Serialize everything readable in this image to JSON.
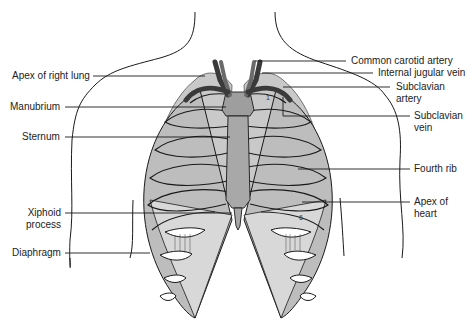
{
  "figure": {
    "colors": {
      "outline": "#1a1a1a",
      "rib_fill": "#b4b4b4",
      "rib_light": "#d6d6d6",
      "cartilage": "#e8e8e8",
      "sternum": "#a8a8a8",
      "vessel": "#555555",
      "background": "#ffffff"
    },
    "rib_numbers": [
      "1",
      "6"
    ]
  },
  "labels_left": [
    {
      "id": "apex-right-lung",
      "lines": [
        "Apex of right lung"
      ]
    },
    {
      "id": "manubrium",
      "lines": [
        "Manubrium"
      ]
    },
    {
      "id": "sternum",
      "lines": [
        "Sternum"
      ]
    },
    {
      "id": "xiphoid-process",
      "lines": [
        "Xiphoid",
        "process"
      ]
    },
    {
      "id": "diaphragm",
      "lines": [
        "Diaphragm"
      ]
    }
  ],
  "labels_right": [
    {
      "id": "common-carotid-artery",
      "lines": [
        "Common carotid artery"
      ]
    },
    {
      "id": "internal-jugular-vein",
      "lines": [
        "Internal jugular vein"
      ]
    },
    {
      "id": "subclavian-artery",
      "lines": [
        "Subclavian",
        "artery"
      ]
    },
    {
      "id": "subclavian-vein",
      "lines": [
        "Subclavian",
        "vein"
      ]
    },
    {
      "id": "fourth-rib",
      "lines": [
        "Fourth rib"
      ]
    },
    {
      "id": "apex-of-heart",
      "lines": [
        "Apex of",
        "heart"
      ]
    }
  ]
}
